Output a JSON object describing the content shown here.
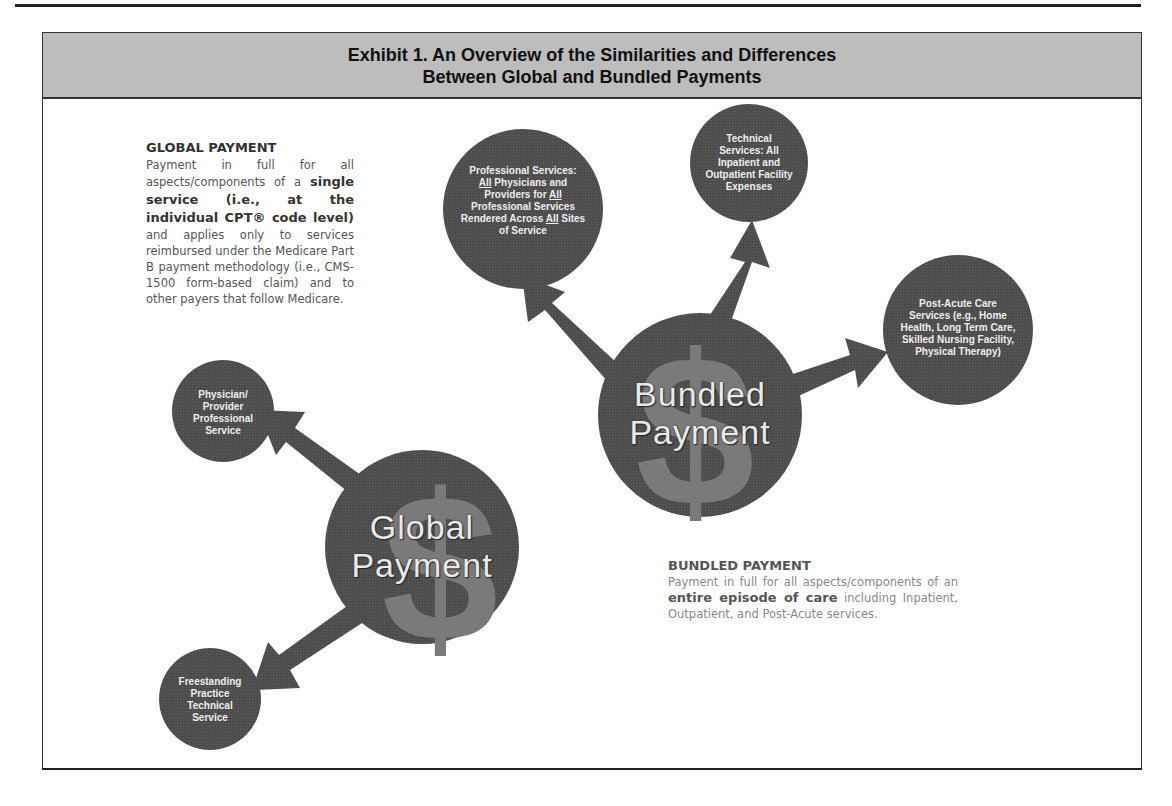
{
  "exhibit": {
    "title_line1": "Exhibit 1. An Overview of the Similarities and Differences",
    "title_line2": "Between Global and Bundled Payments"
  },
  "global_payment": {
    "heading": "GLOBAL PAYMENT",
    "text_intro": "Payment in full for all aspects/components of a",
    "text_bold": "single service (i.e., at the individual CPT® code level)",
    "text_rest": "and applies only to services reimbursed under the Medicare Part B payment methodology (i.e., CMS-1500 form-based claim) and to other payers that follow Medicare.",
    "center_label_line1": "Global",
    "center_label_line2": "Payment",
    "nodes": [
      {
        "label": "Physician/ Provider Professional Service"
      },
      {
        "label": "Freestanding Practice Technical Service"
      }
    ]
  },
  "bundled_payment": {
    "heading": "BUNDLED PAYMENT",
    "text_intro": "Payment in full for all aspects/components of an",
    "text_bold": "entire episode of care",
    "text_rest": "including Inpatient, Outpatient, and Post-Acute services.",
    "center_label_line1": "Bundled",
    "center_label_line2": "Payment",
    "nodes": [
      {
        "label_parts": [
          "Professional Services:",
          "All",
          " Physicians and Providers for ",
          "All",
          " Professional Services Rendered Across ",
          "All",
          " Sites of Service"
        ]
      },
      {
        "label": "Technical Services: All Inpatient and Outpatient Facility Expenses"
      },
      {
        "label": "Post-Acute Care Services (e.g., Home Health, Long Term Care, Skilled Nursing Facility, Physical Therapy)"
      }
    ]
  },
  "colors": {
    "circle_fill": "#4f4f4f",
    "dollar_fill": "#7a7a7a",
    "header_band": "#bdbdbd"
  }
}
